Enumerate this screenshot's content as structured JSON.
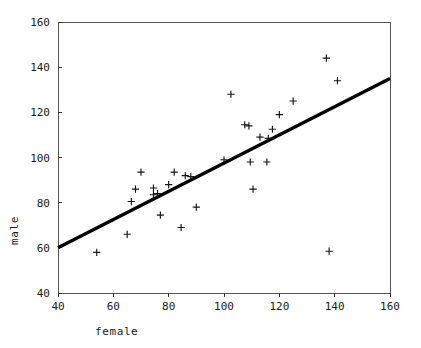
{
  "chart_data": {
    "type": "scatter",
    "title": "",
    "xlabel": "female",
    "ylabel": "male",
    "xlim": [
      40,
      160
    ],
    "ylim": [
      40,
      160
    ],
    "xticks": [
      40,
      60,
      80,
      100,
      120,
      140,
      160
    ],
    "yticks": [
      40,
      60,
      80,
      100,
      120,
      140,
      160
    ],
    "grid": false,
    "legend": null,
    "marker": "plus",
    "marker_color": "#151515",
    "points": [
      {
        "x": 54.0,
        "y": 58.0
      },
      {
        "x": 65.0,
        "y": 66.0
      },
      {
        "x": 66.5,
        "y": 80.5
      },
      {
        "x": 68.0,
        "y": 86.0
      },
      {
        "x": 70.0,
        "y": 93.5
      },
      {
        "x": 74.5,
        "y": 83.5
      },
      {
        "x": 74.5,
        "y": 86.5
      },
      {
        "x": 76.0,
        "y": 84.0
      },
      {
        "x": 77.0,
        "y": 74.5
      },
      {
        "x": 80.0,
        "y": 88.0
      },
      {
        "x": 82.0,
        "y": 93.5
      },
      {
        "x": 84.5,
        "y": 69.0
      },
      {
        "x": 86.0,
        "y": 92.0
      },
      {
        "x": 88.0,
        "y": 91.5
      },
      {
        "x": 90.0,
        "y": 78.0
      },
      {
        "x": 100.0,
        "y": 99.0
      },
      {
        "x": 102.5,
        "y": 128.0
      },
      {
        "x": 107.5,
        "y": 114.5
      },
      {
        "x": 109.0,
        "y": 114.0
      },
      {
        "x": 109.5,
        "y": 98.0
      },
      {
        "x": 110.5,
        "y": 86.0
      },
      {
        "x": 113.0,
        "y": 109.0
      },
      {
        "x": 116.0,
        "y": 108.5
      },
      {
        "x": 115.5,
        "y": 98.0
      },
      {
        "x": 117.5,
        "y": 112.5
      },
      {
        "x": 120.0,
        "y": 119.0
      },
      {
        "x": 125.0,
        "y": 125.0
      },
      {
        "x": 137.0,
        "y": 144.0
      },
      {
        "x": 138.0,
        "y": 58.5
      },
      {
        "x": 141.0,
        "y": 134.0
      }
    ],
    "fit_line": {
      "label": "",
      "color": "#000000",
      "x_start": 40,
      "y_start": 60,
      "x_end": 160,
      "y_end": 135
    }
  }
}
